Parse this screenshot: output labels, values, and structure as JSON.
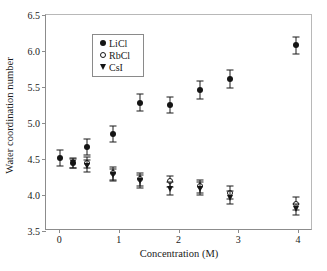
{
  "chart_data": {
    "type": "scatter",
    "title": "",
    "xlabel": "Concentration (M)",
    "ylabel": "Water coordination number",
    "xlim": [
      -0.22,
      4.25
    ],
    "ylim": [
      3.5,
      6.5
    ],
    "xticks": [
      0,
      1,
      2,
      3,
      4
    ],
    "xtick_labels": [
      "0",
      "1",
      "2",
      "3",
      "4"
    ],
    "yticks": [
      3.5,
      4.0,
      4.5,
      5.0,
      5.5,
      6.0,
      6.5
    ],
    "ytick_labels": [
      "3.5",
      "4.0",
      "4.5",
      "5.0",
      "5.5",
      "6.0",
      "6.5"
    ],
    "grid": false,
    "legend_position": "upper left",
    "error_bars": "y",
    "series": [
      {
        "name": "LiCl",
        "marker": "filled-circle",
        "color": "#141414",
        "points": [
          {
            "x": 0.02,
            "y": 4.51,
            "yerr": 0.11
          },
          {
            "x": 0.24,
            "y": 4.44,
            "yerr": 0.07
          },
          {
            "x": 0.46,
            "y": 4.67,
            "yerr": 0.11
          },
          {
            "x": 0.9,
            "y": 4.85,
            "yerr": 0.11
          },
          {
            "x": 1.36,
            "y": 5.28,
            "yerr": 0.12
          },
          {
            "x": 1.85,
            "y": 5.25,
            "yerr": 0.11
          },
          {
            "x": 2.35,
            "y": 5.46,
            "yerr": 0.12
          },
          {
            "x": 2.86,
            "y": 5.61,
            "yerr": 0.13
          },
          {
            "x": 3.96,
            "y": 6.08,
            "yerr": 0.12
          }
        ]
      },
      {
        "name": "RbCl",
        "marker": "open-circle",
        "color": "#141414",
        "points": [
          {
            "x": 0.46,
            "y": 4.45,
            "yerr": 0.08
          },
          {
            "x": 0.9,
            "y": 4.3,
            "yerr": 0.09
          },
          {
            "x": 1.36,
            "y": 4.22,
            "yerr": 0.09
          },
          {
            "x": 1.85,
            "y": 4.19,
            "yerr": 0.08
          },
          {
            "x": 2.35,
            "y": 4.12,
            "yerr": 0.09
          },
          {
            "x": 2.86,
            "y": 4.03,
            "yerr": 0.09
          },
          {
            "x": 3.96,
            "y": 3.88,
            "yerr": 0.09
          }
        ]
      },
      {
        "name": "CsI",
        "marker": "filled-triangle-down",
        "color": "#141414",
        "points": [
          {
            "x": 0.24,
            "y": 4.44,
            "yerr": 0.06
          },
          {
            "x": 0.46,
            "y": 4.4,
            "yerr": 0.08
          },
          {
            "x": 0.9,
            "y": 4.28,
            "yerr": 0.08
          },
          {
            "x": 1.36,
            "y": 4.19,
            "yerr": 0.09
          },
          {
            "x": 1.85,
            "y": 4.09,
            "yerr": 0.09
          },
          {
            "x": 2.35,
            "y": 4.09,
            "yerr": 0.09
          },
          {
            "x": 2.86,
            "y": 3.96,
            "yerr": 0.09
          },
          {
            "x": 3.96,
            "y": 3.8,
            "yerr": 0.08
          }
        ]
      }
    ]
  },
  "legend": {
    "entries": [
      {
        "label": "LiCl",
        "marker": "filled-circle"
      },
      {
        "label": "RbCl",
        "marker": "open-circle"
      },
      {
        "label": "CsI",
        "marker": "filled-triangle-down"
      }
    ]
  },
  "colors": {
    "marker": "#141414",
    "axis": "#8c8c8c",
    "background": "#ffffff"
  }
}
